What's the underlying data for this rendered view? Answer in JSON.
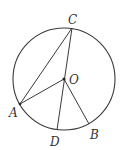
{
  "diagram": {
    "type": "circle-geometry",
    "circle": {
      "center": "O",
      "cx": 64,
      "cy": 79,
      "r": 51
    },
    "points": {
      "C": {
        "label": "C",
        "x": 72,
        "y": 28
      },
      "O": {
        "label": "O",
        "x": 64,
        "y": 79
      },
      "A": {
        "label": "A",
        "x": 20,
        "y": 104
      },
      "D": {
        "label": "D",
        "x": 57,
        "y": 130
      },
      "B": {
        "label": "B",
        "x": 89,
        "y": 124
      }
    },
    "segments": [
      [
        "A",
        "C"
      ],
      [
        "C",
        "D"
      ],
      [
        "A",
        "O"
      ],
      [
        "O",
        "B"
      ]
    ],
    "stroke_color": "#333333"
  }
}
